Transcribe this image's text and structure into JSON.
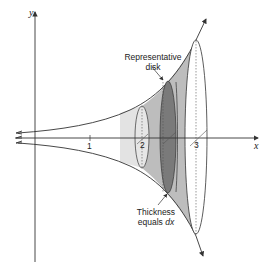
{
  "diagram": {
    "axes": {
      "x_label": "x",
      "y_label": "y",
      "x_ticks": [
        "1",
        "2",
        "3"
      ]
    },
    "annotations": {
      "representative_disk": {
        "line1": "Representative",
        "line2": "disk"
      },
      "thickness": {
        "line1": "Thickness",
        "line2_prefix": "equals ",
        "line2_var": "dx"
      }
    },
    "colors": {
      "light_fill": "#d9d9d9",
      "mid_fill": "#bdbdbd",
      "dark_disk": "#7a7a7a",
      "stroke": "#333333"
    }
  }
}
